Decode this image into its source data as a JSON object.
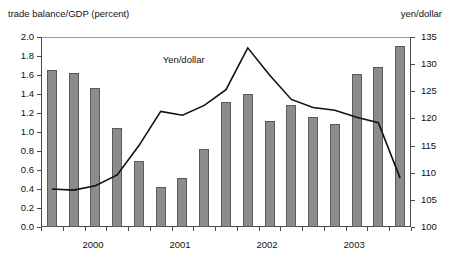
{
  "axis_titles": {
    "left": "trade balance/GDP (percent)",
    "right": "yen/dollar"
  },
  "annotations": {
    "line_label": "Yen/dollar"
  },
  "colors": {
    "bar_fill": "#8c8c8c",
    "bar_stroke": "#5a5a5a",
    "line": "#111111",
    "axis": "#4a4a4a",
    "background": "#ffffff"
  },
  "chart_data": {
    "type": "bar",
    "title": "",
    "xlabel": "",
    "ylabel": "trade balance/GDP (percent)",
    "y2label": "yen/dollar",
    "ylim": [
      0.0,
      2.0
    ],
    "y2lim": [
      100,
      135
    ],
    "yticks": [
      "0.0",
      "0.2",
      "0.4",
      "0.6",
      "0.8",
      "1.0",
      "1.2",
      "1.4",
      "1.6",
      "1.8",
      "2.0"
    ],
    "y2ticks": [
      "100",
      "105",
      "110",
      "115",
      "120",
      "125",
      "130",
      "135"
    ],
    "grid": false,
    "legend": "none",
    "categories": [
      "1999Q4",
      "2000Q1",
      "2000Q2",
      "2000Q3",
      "2000Q4",
      "2001Q1",
      "2001Q2",
      "2001Q3",
      "2001Q4",
      "2002Q1",
      "2002Q2",
      "2002Q3",
      "2002Q4",
      "2003Q1",
      "2003Q2",
      "2003Q3",
      "2003Q4"
    ],
    "xtick_labels": [
      "2000",
      "2001",
      "2002",
      "2003"
    ],
    "xtick_label_positions": [
      2.5,
      6.5,
      10.5,
      14.5
    ],
    "series": [
      {
        "name": "trade balance/GDP (percent)",
        "type": "bar",
        "axis": "left",
        "values": [
          1.65,
          1.62,
          1.46,
          1.04,
          0.7,
          0.42,
          0.52,
          0.82,
          1.32,
          1.4,
          1.12,
          1.28,
          1.16,
          1.08,
          1.61,
          1.68,
          1.91
        ]
      },
      {
        "name": "Yen/dollar",
        "type": "line",
        "axis": "right",
        "values": [
          107.0,
          106.8,
          107.6,
          109.6,
          115.0,
          121.3,
          120.6,
          122.4,
          125.3,
          133.0,
          128.0,
          123.5,
          122.0,
          121.5,
          120.2,
          119.2,
          109.0
        ]
      }
    ]
  }
}
